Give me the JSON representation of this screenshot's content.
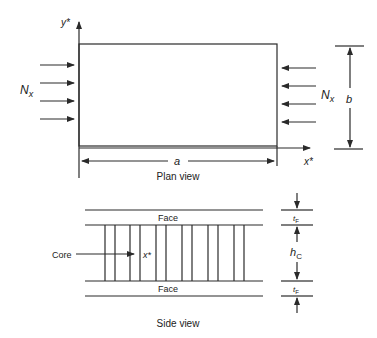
{
  "plan_view": {
    "caption": "Plan view",
    "y_axis_label": "y*",
    "x_axis_label": "x*",
    "load_left_label": "N",
    "load_left_sub": "x",
    "load_right_label": "N",
    "load_right_sub": "x",
    "length_label": "a",
    "width_label": "b",
    "left_arrow_count": 4,
    "right_arrow_count": 4
  },
  "side_view": {
    "caption": "Side view",
    "top_face_label": "Face",
    "bottom_face_label": "Face",
    "core_label": "Core",
    "x_axis_label": "x*",
    "face_thickness_top_label": "t",
    "face_thickness_top_sub": "F",
    "core_thickness_label": "h",
    "core_thickness_sub": "C",
    "face_thickness_bottom_label": "t",
    "face_thickness_bottom_sub": "F"
  },
  "colors": {
    "line": "#2a2a2a",
    "background": "#ffffff"
  }
}
